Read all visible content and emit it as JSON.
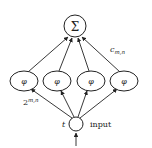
{
  "diagram": {
    "output_node": {
      "label": "Σ"
    },
    "hidden_nodes": [
      {
        "label": "φ"
      },
      {
        "label": "φ"
      },
      {
        "label": "φ"
      },
      {
        "label": "φ"
      }
    ],
    "input_node": {
      "label": ""
    },
    "labels": {
      "weights_top_base": "c",
      "weights_top_sub": "m,n",
      "weights_bottom_base": "2",
      "weights_bottom_sup": "m,n",
      "input_variable": "t",
      "input_text": "input"
    },
    "colors": {
      "stroke": "#222222",
      "background": "#ffffff"
    }
  }
}
